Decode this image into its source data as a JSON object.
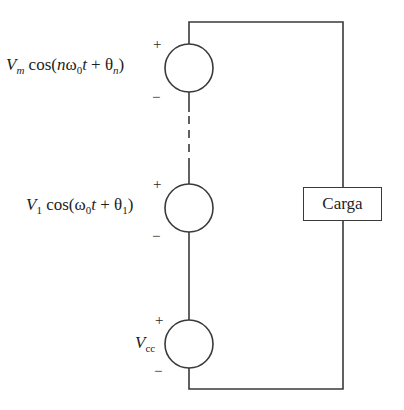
{
  "diagram": {
    "type": "circuit",
    "sources": [
      {
        "id": "nth-harmonic",
        "amplitude_symbol": "V",
        "amplitude_sub": "m",
        "func": "cos(",
        "arg_n": "n",
        "arg_omega": "ω",
        "arg_omega_sub": "0",
        "arg_t": "t",
        "plus": " + ",
        "arg_theta": "θ",
        "arg_theta_sub": "n",
        "close": ")",
        "pos_sign": "+",
        "neg_sign": "−"
      },
      {
        "id": "fundamental",
        "amplitude_symbol": "V",
        "amplitude_sub": "1",
        "func": " cos(",
        "arg_omega": "ω",
        "arg_omega_sub": "0",
        "arg_t": "t",
        "plus": " + ",
        "arg_theta": "θ",
        "arg_theta_sub": "1",
        "close": ")",
        "pos_sign": "+",
        "neg_sign": "−"
      },
      {
        "id": "dc",
        "amplitude_symbol": "V",
        "amplitude_sub": "cc",
        "pos_sign": "+",
        "neg_sign": "−"
      }
    ],
    "load": {
      "label": "Carga"
    },
    "colors": {
      "wire": "#3a3a3a",
      "text": "#1e1e1e",
      "background": "#ffffff"
    }
  }
}
